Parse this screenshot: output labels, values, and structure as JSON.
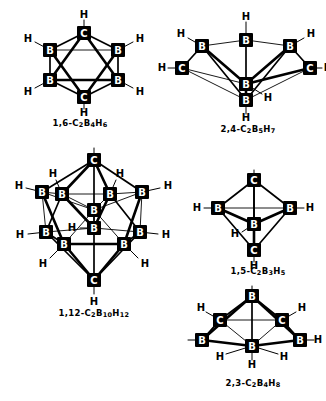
{
  "figure": {
    "kind": "chemical-structure-diagram",
    "background_color": "#ffffff",
    "ink_color": "#000000"
  },
  "atom_labels": {
    "boron": "B",
    "carbon": "C",
    "hydrogen": "H"
  },
  "structures": [
    {
      "id": "c2b4h6",
      "caption_prefix": "1,6-C",
      "caption_parts": [
        {
          "text": "1,6-C",
          "sub": false
        },
        {
          "text": "2",
          "sub": true
        },
        {
          "text": "B",
          "sub": false
        },
        {
          "text": "4",
          "sub": true
        },
        {
          "text": "H",
          "sub": false
        },
        {
          "text": "6",
          "sub": true
        }
      ],
      "caption_plain": "1,6-C2B4H6",
      "polyhedron": "octahedron",
      "vertices": [
        "C",
        "B",
        "B",
        "B",
        "B",
        "C"
      ],
      "carbon_count": 2,
      "boron_count": 4,
      "hydrogen_count": 6
    },
    {
      "id": "c2b5h7",
      "caption_parts": [
        {
          "text": "2,4-C",
          "sub": false
        },
        {
          "text": "2",
          "sub": true
        },
        {
          "text": "B",
          "sub": false
        },
        {
          "text": "5",
          "sub": true
        },
        {
          "text": "H",
          "sub": false
        },
        {
          "text": "7",
          "sub": true
        }
      ],
      "caption_plain": "2,4-C2B5H7",
      "polyhedron": "pentagonal bipyramid",
      "vertices": [
        "B",
        "B",
        "C",
        "B",
        "C",
        "B",
        "B"
      ],
      "carbon_count": 2,
      "boron_count": 5,
      "hydrogen_count": 7
    },
    {
      "id": "c2b10h12",
      "caption_parts": [
        {
          "text": "1,12-C",
          "sub": false
        },
        {
          "text": "2",
          "sub": true
        },
        {
          "text": "B",
          "sub": false
        },
        {
          "text": "10",
          "sub": true
        },
        {
          "text": "H",
          "sub": false
        },
        {
          "text": "12",
          "sub": true
        }
      ],
      "caption_plain": "1,12-C2B10H12",
      "polyhedron": "icosahedron",
      "carbon_count": 2,
      "boron_count": 10,
      "hydrogen_count": 12
    },
    {
      "id": "c2b3h5",
      "caption_parts": [
        {
          "text": "1,5-C",
          "sub": false
        },
        {
          "text": "2",
          "sub": true
        },
        {
          "text": "B",
          "sub": false
        },
        {
          "text": "3",
          "sub": true
        },
        {
          "text": "H",
          "sub": false
        },
        {
          "text": "5",
          "sub": true
        }
      ],
      "caption_plain": "1,5-C2B3H5",
      "polyhedron": "trigonal bipyramid",
      "vertices": [
        "C",
        "B",
        "B",
        "B",
        "C"
      ],
      "carbon_count": 2,
      "boron_count": 3,
      "hydrogen_count": 5
    },
    {
      "id": "c2b4h8",
      "caption_parts": [
        {
          "text": "2,3-C",
          "sub": false
        },
        {
          "text": "2",
          "sub": true
        },
        {
          "text": "B",
          "sub": false
        },
        {
          "text": "4",
          "sub": true
        },
        {
          "text": "H",
          "sub": false
        },
        {
          "text": "8",
          "sub": true
        }
      ],
      "caption_plain": "2,3-C2B4H8",
      "polyhedron": "pentagonal pyramid (nido)",
      "carbon_count": 2,
      "boron_count": 4,
      "hydrogen_count": 8
    }
  ]
}
